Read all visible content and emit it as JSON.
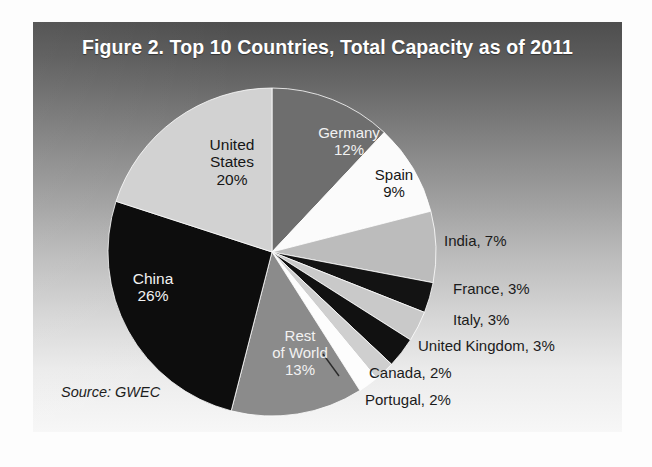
{
  "figure": {
    "title": "Figure 2. Top 10 Countries, Total Capacity as of 2011",
    "source_note": "Source: GWEC"
  },
  "chart_data": {
    "type": "pie",
    "title": "Figure 2. Top 10 Countries, Total Capacity as of 2011",
    "xlabel": "",
    "ylabel": "",
    "unit": "percent",
    "source": "Source: GWEC",
    "legend_position": "none",
    "grid": false,
    "start_angle_deg": 0,
    "direction": "clockwise",
    "categories": [
      "Germany",
      "Spain",
      "India",
      "France",
      "Italy",
      "United Kingdom",
      "Canada",
      "Portugal",
      "Rest of World",
      "China",
      "United States"
    ],
    "values": [
      12,
      9,
      7,
      3,
      3,
      3,
      2,
      2,
      13,
      26,
      20
    ],
    "slices": [
      {
        "name": "Germany",
        "value": 12,
        "display": "12%",
        "label_lines": [
          "Germany",
          "12%"
        ],
        "color": "#6e6e6e",
        "text_color": "#f2f2f2",
        "label_placement": "inside"
      },
      {
        "name": "Spain",
        "value": 9,
        "display": "9%",
        "label_lines": [
          "Spain",
          "9%"
        ],
        "color": "#fbfbfb",
        "text_color": "#161616",
        "label_placement": "inside"
      },
      {
        "name": "India",
        "value": 7,
        "display": "7%",
        "label_lines": [
          "India, 7%"
        ],
        "color": "#bcbcbc",
        "text_color": "#1b1b1b",
        "label_placement": "outside"
      },
      {
        "name": "France",
        "value": 3,
        "display": "3%",
        "label_lines": [
          "France, 3%"
        ],
        "color": "#131313",
        "text_color": "#1b1b1b",
        "label_placement": "outside"
      },
      {
        "name": "Italy",
        "value": 3,
        "display": "3%",
        "label_lines": [
          "Italy, 3%"
        ],
        "color": "#c9c9c9",
        "text_color": "#1b1b1b",
        "label_placement": "outside"
      },
      {
        "name": "United Kingdom",
        "value": 3,
        "display": "3%",
        "label_lines": [
          "United Kingdom, 3%"
        ],
        "color": "#111111",
        "text_color": "#1b1b1b",
        "label_placement": "outside"
      },
      {
        "name": "Canada",
        "value": 2,
        "display": "2%",
        "label_lines": [
          "Canada, 2%"
        ],
        "color": "#cfcfcf",
        "text_color": "#1b1b1b",
        "label_placement": "outside"
      },
      {
        "name": "Portugal",
        "value": 2,
        "display": "2%",
        "label_lines": [
          "Portugal, 2%"
        ],
        "color": "#fdfdfd",
        "text_color": "#1b1b1b",
        "label_placement": "outside-leader"
      },
      {
        "name": "Rest of World",
        "value": 13,
        "display": "13%",
        "label_lines": [
          "Rest",
          "of World",
          "13%"
        ],
        "color": "#8b8b8b",
        "text_color": "#f2f2f2",
        "label_placement": "inside"
      },
      {
        "name": "China",
        "value": 26,
        "display": "26%",
        "label_lines": [
          "China",
          "26%"
        ],
        "color": "#0d0d0d",
        "text_color": "#f2f2f2",
        "label_placement": "inside"
      },
      {
        "name": "United States",
        "value": 20,
        "display": "20%",
        "label_lines": [
          "United",
          "States",
          "20%"
        ],
        "color": "#d2d2d2",
        "text_color": "#161616",
        "label_placement": "inside"
      }
    ]
  },
  "labels": {
    "united_states": {
      "name": "United",
      "name2": "States",
      "percent": "20%"
    },
    "germany": {
      "name": "Germany",
      "percent": "12%"
    },
    "spain": {
      "name": "Spain",
      "percent": "9%"
    },
    "china": {
      "name": "China",
      "percent": "26%"
    },
    "rest_of_world": {
      "name": "Rest",
      "name2": "of World",
      "percent": "13%"
    },
    "india": "India, 7%",
    "france": "France, 3%",
    "italy": "Italy, 3%",
    "united_kingdom": "United Kingdom, 3%",
    "canada": "Canada, 2%",
    "portugal": "Portugal, 2%"
  },
  "colors": {
    "panel_top": "#4e4e4e",
    "panel_bottom": "#f7f7f7",
    "title_text": "#ffffff",
    "body_text": "#1b1b1b"
  }
}
